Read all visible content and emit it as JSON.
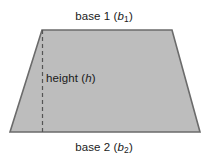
{
  "figure": {
    "kind": "trapezoid-area-diagram",
    "canvas": {
      "width": 208,
      "height": 162
    },
    "colors": {
      "background": "#ffffff",
      "shape_fill": "#bdbdbd",
      "shape_stroke": "#6b6b6b",
      "height_line": "#555555",
      "text": "#1a1a1a"
    },
    "shape": {
      "name": "trapezoid",
      "points": "42,30 172,30 200,132 10,132",
      "stroke_width": 1.6
    },
    "height_line": {
      "x": 42.5,
      "y_top": 30,
      "y_bottom": 132,
      "dash_pattern": "4,3",
      "stroke_width": 1.2
    }
  },
  "labels": {
    "base1": {
      "prefix": "base 1 (",
      "variable": "b",
      "subscript": "1",
      "suffix": ")",
      "full_text": "base 1 (b1)"
    },
    "base2": {
      "prefix": "base 2 (",
      "variable": "b",
      "subscript": "2",
      "suffix": ")",
      "full_text": "base 2 (b2)"
    },
    "height": {
      "prefix": "height (",
      "variable": "h",
      "subscript": "",
      "suffix": ")",
      "full_text": "height (h)"
    }
  }
}
